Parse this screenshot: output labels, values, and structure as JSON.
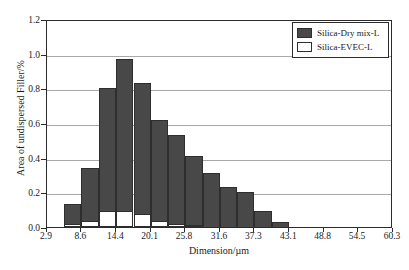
{
  "chart_data": {
    "type": "bar",
    "title": "",
    "subtitle": "",
    "xlabel": "Dimension/µm",
    "ylabel": "Area of undispersed Filler/%",
    "xlim": [
      2.9,
      60.3
    ],
    "ylim": [
      0.0,
      1.2
    ],
    "grid": true,
    "legend_position": "top-right",
    "x_tick_labels": [
      "2.9",
      "8.6",
      "14.4",
      "20.1",
      "25.8",
      "31.6",
      "37.3",
      "43.1",
      "48.8",
      "54.5",
      "60.3"
    ],
    "x_tick_values": [
      2.9,
      8.6,
      14.4,
      20.1,
      25.8,
      31.6,
      37.3,
      43.1,
      48.8,
      54.5,
      60.3
    ],
    "y_tick_labels": [
      "0.0",
      "0.2",
      "0.4",
      "0.6",
      "0.8",
      "1.0",
      "1.2"
    ],
    "y_tick_values": [
      0.0,
      0.2,
      0.4,
      0.6,
      0.8,
      1.0,
      1.2
    ],
    "bin_edges": [
      5.75,
      8.6,
      11.5,
      14.4,
      17.25,
      20.1,
      23.0,
      25.8,
      28.7,
      31.6,
      34.45,
      37.3,
      40.2,
      43.1
    ],
    "categories": [
      "5.75-8.6",
      "8.6-11.5",
      "11.5-14.4",
      "14.4-17.25",
      "17.25-20.1",
      "20.1-23.0",
      "23.0-25.8",
      "25.8-28.7",
      "28.7-31.6",
      "31.6-34.45",
      "34.45-37.3",
      "37.3-40.2",
      "40.2-43.1"
    ],
    "series": [
      {
        "name": "Silica-Dry mix-L",
        "color": "#484848",
        "values": [
          0.13,
          0.34,
          0.8,
          0.97,
          0.83,
          0.62,
          0.53,
          0.41,
          0.31,
          0.23,
          0.2,
          0.09,
          0.03
        ]
      },
      {
        "name": "Silica-EVEC-L",
        "color": "#ffffff",
        "values": [
          0.015,
          0.035,
          0.09,
          0.09,
          0.075,
          0.035,
          0.015,
          0.01,
          0.0,
          0.0,
          0.0,
          0.0,
          0.0
        ]
      }
    ]
  },
  "legend": {
    "entries": [
      {
        "label": "Silica-Dry mix-L",
        "swatch": "dark"
      },
      {
        "label": "Silica-EVEC-L",
        "swatch": "light"
      }
    ]
  },
  "axes": {
    "x_title": "Dimension/µm",
    "y_title": "Area of undispersed Filler/%"
  },
  "colors": {
    "dry_mix": "#484848",
    "evec": "#ffffff",
    "axis": "#2b2b2b",
    "gridline": "#a8a8a8",
    "background": "#ffffff"
  }
}
